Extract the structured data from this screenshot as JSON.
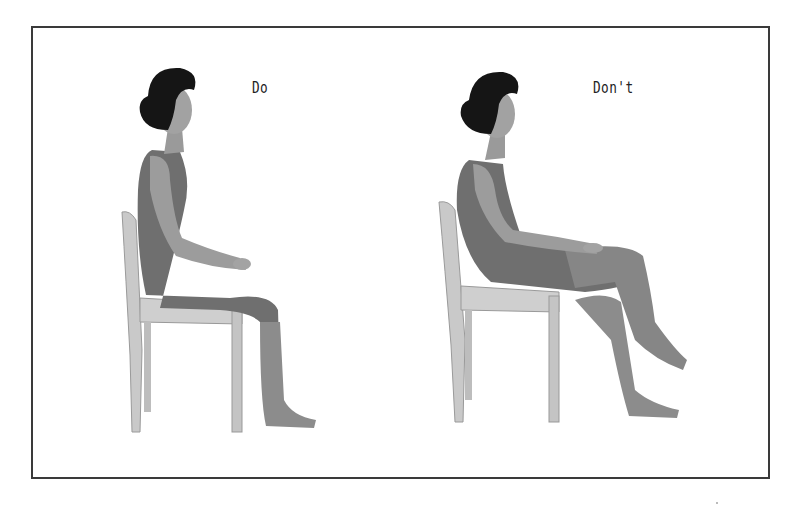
{
  "figure": {
    "panels": [
      {
        "id": "do",
        "label": "Do",
        "description": "Woman seated upright on a wooden chair, back straight, feet flat on floor, hands resting on thighs"
      },
      {
        "id": "dont",
        "label": "Don't",
        "description": "Woman slouched back against chair, hips forward, legs crossed at the knee"
      }
    ],
    "colors": {
      "border": "#3a3a3a",
      "skin": "#9a9a9a",
      "leotard": "#6e6e6e",
      "hair": "#141414",
      "chair": "#c9c9c9",
      "chair_shade": "#a8a8a8"
    }
  }
}
